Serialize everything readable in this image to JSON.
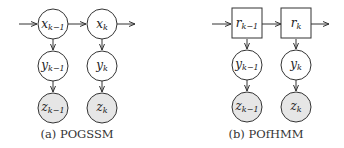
{
  "colors": {
    "stroke": "#333333",
    "observed_fill": "#e6e6e6",
    "latent_fill": "#ffffff"
  },
  "panels": [
    {
      "id": "a",
      "caption": "(a) POGSSM",
      "top_node_shape": "circle",
      "top_nodes": [
        {
          "base": "x",
          "sub": "k−1"
        },
        {
          "base": "x",
          "sub": "k"
        }
      ],
      "mid_nodes": [
        {
          "base": "y",
          "sub": "k−1"
        },
        {
          "base": "y",
          "sub": "k"
        }
      ],
      "bottom_nodes": [
        {
          "base": "z",
          "sub": "k−1",
          "observed": true
        },
        {
          "base": "z",
          "sub": "k",
          "observed": true
        }
      ]
    },
    {
      "id": "b",
      "caption": "(b) POfHMM",
      "top_node_shape": "square",
      "top_nodes": [
        {
          "base": "r",
          "sub": "k−1"
        },
        {
          "base": "r",
          "sub": "k"
        }
      ],
      "mid_nodes": [
        {
          "base": "y",
          "sub": "k−1"
        },
        {
          "base": "y",
          "sub": "k"
        }
      ],
      "bottom_nodes": [
        {
          "base": "z",
          "sub": "k−1",
          "observed": true
        },
        {
          "base": "z",
          "sub": "k",
          "observed": true
        }
      ]
    }
  ]
}
